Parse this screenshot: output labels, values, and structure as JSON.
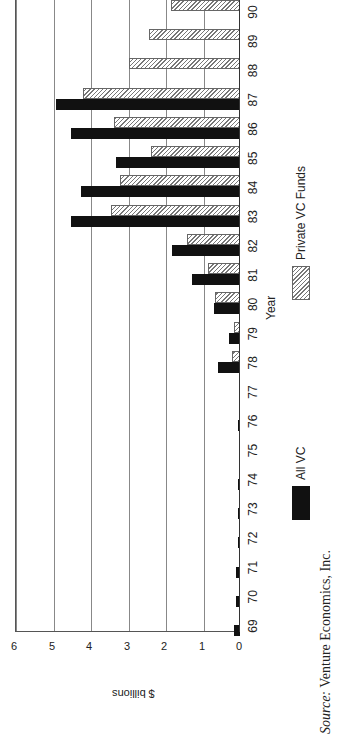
{
  "chart_data": {
    "type": "bar",
    "orientation": "rotated-90-ccw",
    "title": "",
    "xlabel": "Year",
    "ylabel": "$ billions",
    "ylim": [
      0,
      6
    ],
    "yticks": [
      "0",
      "1",
      "2",
      "3",
      "4",
      "5",
      "6"
    ],
    "grid": true,
    "categories": [
      "69",
      "70",
      "71",
      "72",
      "73",
      "74",
      "75",
      "76",
      "77",
      "78",
      "79",
      "80",
      "81",
      "82",
      "83",
      "84",
      "85",
      "86",
      "87",
      "88",
      "89",
      "90"
    ],
    "series": [
      {
        "name": "All VC",
        "color": "#111111",
        "values": [
          0.17,
          0.1,
          0.1,
          0.06,
          0.06,
          0.05,
          0.01,
          0.05,
          0.03,
          0.58,
          0.29,
          0.69,
          1.28,
          1.81,
          4.52,
          4.23,
          3.32,
          4.52,
          4.92,
          null,
          null,
          null
        ]
      },
      {
        "name": "Private VC Funds",
        "pattern": "diagonal-hatch",
        "values": [
          null,
          null,
          null,
          null,
          null,
          null,
          null,
          null,
          null,
          0.21,
          0.16,
          0.66,
          0.85,
          1.41,
          3.43,
          3.19,
          2.37,
          3.35,
          4.2,
          2.95,
          2.42,
          1.84
        ]
      }
    ],
    "legend": {
      "position": "right",
      "entries": [
        "All VC",
        "Private VC Funds"
      ]
    }
  },
  "source": {
    "prefix": "Source:",
    "text": " Venture Economics, Inc."
  }
}
